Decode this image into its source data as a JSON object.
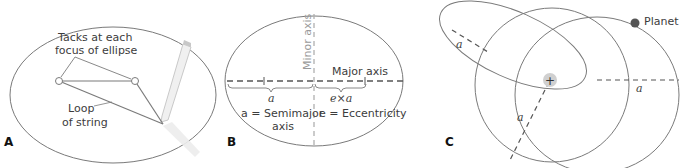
{
  "figure": {
    "panels": [
      {
        "id": "A",
        "label": "A",
        "annotations": {
          "tacks": [
            "Tacks at each",
            "focus of ellipse"
          ],
          "loop": [
            "Loop",
            "of string"
          ]
        }
      },
      {
        "id": "B",
        "label": "B",
        "annotations": {
          "minor_axis": "Minor axis",
          "major_axis": "Major axis",
          "a_symbol": "a",
          "exa": "e×a",
          "semimajor": [
            "a = Semimajor",
            "axis"
          ],
          "eccentricity": "e = Eccentricity"
        }
      },
      {
        "id": "C",
        "label": "C",
        "annotations": {
          "planet": "Planet",
          "a_labels": [
            "a",
            "a",
            "a"
          ]
        }
      }
    ],
    "colors": {
      "line": "#7a7a7a",
      "dashed": "#555555",
      "minor_axis": "#b0b0b0",
      "planet": "#555555",
      "sun_glow": "#d0d0d0"
    }
  }
}
